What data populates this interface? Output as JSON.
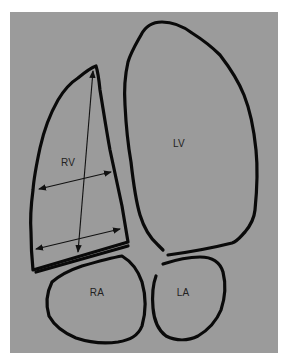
{
  "diagram": {
    "background_color": "#9b9b9b",
    "outline_color": "#0a0a0a",
    "chambers": [
      {
        "id": "rv",
        "label": "RV",
        "label_pos": [
          68,
          162
        ]
      },
      {
        "id": "lv",
        "label": "LV",
        "label_pos": [
          179,
          142
        ]
      },
      {
        "id": "ra",
        "label": "RA",
        "label_pos": [
          97,
          292
        ]
      },
      {
        "id": "la",
        "label": "LA",
        "label_pos": [
          183,
          292
        ]
      }
    ],
    "measurements": [
      {
        "id": "rv-long-axis",
        "type": "double-arrow",
        "from": [
          93,
          70
        ],
        "to": [
          78,
          252
        ]
      },
      {
        "id": "rv-mid-diameter",
        "type": "double-arrow",
        "from": [
          38,
          189
        ],
        "to": [
          111,
          172
        ]
      },
      {
        "id": "rv-basal-diameter",
        "type": "double-arrow",
        "from": [
          35,
          250
        ],
        "to": [
          120,
          229
        ]
      }
    ]
  }
}
